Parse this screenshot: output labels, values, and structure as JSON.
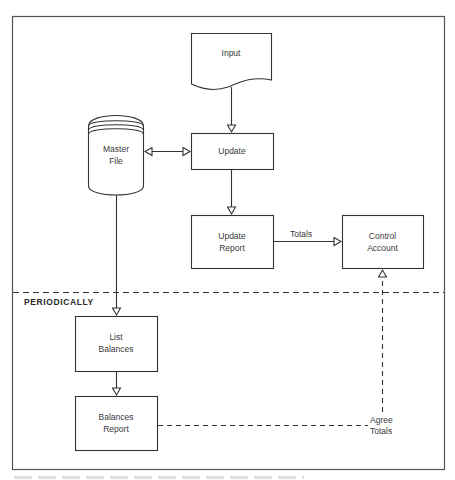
{
  "diagram": {
    "nodes": {
      "input": {
        "label": "Input",
        "shape": "document"
      },
      "master_file": {
        "label_line1": "Master",
        "label_line2": "File",
        "shape": "cylinder"
      },
      "update": {
        "label": "Update",
        "shape": "rectangle"
      },
      "update_report": {
        "label_line1": "Update",
        "label_line2": "Report",
        "shape": "rectangle"
      },
      "control_account": {
        "label_line1": "Control",
        "label_line2": "Account",
        "shape": "rectangle"
      },
      "list_balances": {
        "label_line1": "List",
        "label_line2": "Balances",
        "shape": "rectangle"
      },
      "balances_report": {
        "label_line1": "Balances",
        "label_line2": "Report",
        "shape": "rectangle"
      }
    },
    "edges": [
      {
        "from": "input",
        "to": "update",
        "style": "solid"
      },
      {
        "from": "master_file",
        "to": "update",
        "style": "solid",
        "bidirectional": true
      },
      {
        "from": "update",
        "to": "update_report",
        "style": "solid"
      },
      {
        "from": "update_report",
        "to": "control_account",
        "style": "solid",
        "label": "Totals"
      },
      {
        "from": "master_file",
        "to": "list_balances",
        "style": "solid"
      },
      {
        "from": "list_balances",
        "to": "balances_report",
        "style": "solid"
      },
      {
        "from": "balances_report",
        "to": "control_account",
        "style": "dashed",
        "label_line1": "Agree",
        "label_line2": "Totals"
      }
    ],
    "edge_labels": {
      "totals": "Totals",
      "agree": "Agree",
      "agree_totals": "Totals"
    },
    "section": {
      "label": "PERIODICALLY",
      "divider_style": "dashed"
    },
    "colors": {
      "stroke": "#333333",
      "background": "#ffffff",
      "frame": "#555555"
    }
  }
}
